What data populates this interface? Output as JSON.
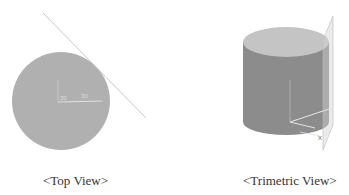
{
  "top_view": {
    "caption": "<Top View>",
    "label_a": "30",
    "label_b": "30"
  },
  "trimetric_view": {
    "caption": "<Trimetric View>",
    "axis_label": "X"
  },
  "colors": {
    "cylinder_side": "#8c8c8c",
    "cylinder_top": "#c4c4c4",
    "circle_fill": "#b0b0b0",
    "plane_line": "#c8c8c8",
    "axis": "#e6e6e6"
  }
}
